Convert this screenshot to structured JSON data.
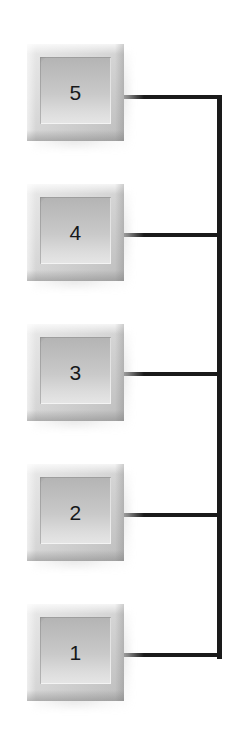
{
  "diagram": {
    "canvas": {
      "width": 246,
      "height": 756,
      "background": "#ffffff"
    },
    "style": {
      "box_face_color": "#c4c4c4",
      "box_frame_light": "#e9e9e9",
      "box_frame_dark": "#bdbdbd",
      "connector_color": "#1a1a1a",
      "label_color": "#16181a",
      "shadow_color": "#969696"
    },
    "connector": {
      "orientation": "vertical-spine-right",
      "spine_x": 217,
      "spine_top_y": 95,
      "spine_bottom_y": 655,
      "spine_thickness": 5,
      "branch_thickness": 4,
      "branch_start_x": 118,
      "branch_count": 5
    },
    "nodes": [
      {
        "label": "5",
        "x": 27,
        "y": 44,
        "width": 97,
        "height": 97,
        "branch_y": 95
      },
      {
        "label": "4",
        "x": 27,
        "y": 184,
        "width": 97,
        "height": 97,
        "branch_y": 233
      },
      {
        "label": "3",
        "x": 27,
        "y": 324,
        "width": 97,
        "height": 97,
        "branch_y": 372
      },
      {
        "label": "2",
        "x": 27,
        "y": 464,
        "width": 97,
        "height": 97,
        "branch_y": 513
      },
      {
        "label": "1",
        "x": 27,
        "y": 604,
        "width": 97,
        "height": 97,
        "branch_y": 653
      }
    ]
  }
}
